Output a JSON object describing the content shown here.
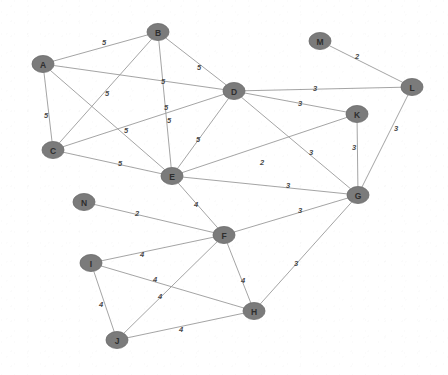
{
  "diagram": {
    "type": "node-link-graph",
    "node_count": 14,
    "edge_count": 28,
    "style": {
      "node_fill": "#7b7b7b",
      "node_stroke": "#6a6a6a",
      "node_label_color": "#2e2e2e",
      "edge_color": "#9a9a9a",
      "edge_label_color": "#4a4a4a",
      "background": "#ffffff"
    }
  },
  "chart_data": {
    "type": "graph",
    "directed": false,
    "weighted": true,
    "nodes": [
      {
        "id": "A",
        "label": "A",
        "x": 43,
        "y": 64
      },
      {
        "id": "B",
        "label": "B",
        "x": 158,
        "y": 32
      },
      {
        "id": "C",
        "label": "C",
        "x": 53,
        "y": 150
      },
      {
        "id": "D",
        "label": "D",
        "x": 234,
        "y": 91
      },
      {
        "id": "E",
        "label": "E",
        "x": 172,
        "y": 176
      },
      {
        "id": "F",
        "label": "F",
        "x": 224,
        "y": 235
      },
      {
        "id": "G",
        "label": "G",
        "x": 358,
        "y": 195
      },
      {
        "id": "H",
        "label": "H",
        "x": 254,
        "y": 311
      },
      {
        "id": "I",
        "label": "I",
        "x": 91,
        "y": 263
      },
      {
        "id": "J",
        "label": "J",
        "x": 117,
        "y": 340
      },
      {
        "id": "K",
        "label": "K",
        "x": 357,
        "y": 114
      },
      {
        "id": "L",
        "label": "L",
        "x": 412,
        "y": 87
      },
      {
        "id": "M",
        "label": "M",
        "x": 320,
        "y": 41
      },
      {
        "id": "N",
        "label": "N",
        "x": 84,
        "y": 202
      }
    ],
    "edges": [
      {
        "source": "A",
        "target": "B",
        "weight": 5,
        "lx": 104,
        "ly": 43
      },
      {
        "source": "A",
        "target": "C",
        "weight": 5,
        "lx": 46,
        "ly": 116
      },
      {
        "source": "A",
        "target": "D",
        "weight": 5,
        "lx": 163,
        "ly": 82
      },
      {
        "source": "A",
        "target": "E",
        "weight": 5,
        "lx": 126,
        "ly": 131
      },
      {
        "source": "B",
        "target": "C",
        "weight": 5,
        "lx": 107,
        "ly": 94
      },
      {
        "source": "B",
        "target": "D",
        "weight": 5,
        "lx": 199,
        "ly": 68
      },
      {
        "source": "B",
        "target": "E",
        "weight": 5,
        "lx": 166,
        "ly": 108
      },
      {
        "source": "C",
        "target": "D",
        "weight": 5,
        "lx": 169,
        "ly": 121
      },
      {
        "source": "C",
        "target": "E",
        "weight": 5,
        "lx": 120,
        "ly": 164
      },
      {
        "source": "D",
        "target": "E",
        "weight": 5,
        "lx": 198,
        "ly": 140
      },
      {
        "source": "D",
        "target": "L",
        "weight": 3,
        "lx": 315,
        "ly": 89
      },
      {
        "source": "D",
        "target": "K",
        "weight": 3,
        "lx": 300,
        "ly": 104
      },
      {
        "source": "D",
        "target": "G",
        "weight": 3,
        "lx": 311,
        "ly": 153
      },
      {
        "source": "K",
        "target": "G",
        "weight": 3,
        "lx": 354,
        "ly": 148
      },
      {
        "source": "L",
        "target": "G",
        "weight": 3,
        "lx": 396,
        "ly": 129
      },
      {
        "source": "M",
        "target": "L",
        "weight": 2,
        "lx": 357,
        "ly": 57
      },
      {
        "source": "E",
        "target": "G",
        "weight": 3,
        "lx": 288,
        "ly": 186
      },
      {
        "source": "E",
        "target": "K",
        "weight": 2,
        "lx": 262,
        "ly": 163
      },
      {
        "source": "F",
        "target": "G",
        "weight": 3,
        "lx": 300,
        "ly": 211
      },
      {
        "source": "G",
        "target": "H",
        "weight": 3,
        "lx": 296,
        "ly": 264
      },
      {
        "source": "N",
        "target": "F",
        "weight": 2,
        "lx": 137,
        "ly": 214
      },
      {
        "source": "I",
        "target": "F",
        "weight": 4,
        "lx": 142,
        "ly": 255
      },
      {
        "source": "I",
        "target": "H",
        "weight": 4,
        "lx": 155,
        "ly": 280
      },
      {
        "source": "I",
        "target": "J",
        "weight": 4,
        "lx": 101,
        "ly": 305
      },
      {
        "source": "J",
        "target": "F",
        "weight": 4,
        "lx": 160,
        "ly": 297
      },
      {
        "source": "J",
        "target": "H",
        "weight": 4,
        "lx": 181,
        "ly": 330
      },
      {
        "source": "F",
        "target": "H",
        "weight": 4,
        "lx": 243,
        "ly": 281
      },
      {
        "source": "E",
        "target": "F",
        "weight": 4,
        "lx": 196,
        "ly": 205
      }
    ]
  }
}
